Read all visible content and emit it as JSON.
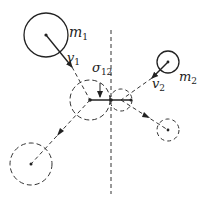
{
  "diagram": {
    "type": "two-body collision",
    "labels": {
      "m1": "m",
      "m1_sub": "1",
      "m2": "m",
      "m2_sub": "2",
      "v1": "v",
      "v1_sub": "1",
      "v2": "v",
      "v2_sub": "2",
      "sigma": "σ",
      "sigma_sub": "12"
    },
    "colors": {
      "stroke": "#222222",
      "background": "#ffffff"
    }
  }
}
